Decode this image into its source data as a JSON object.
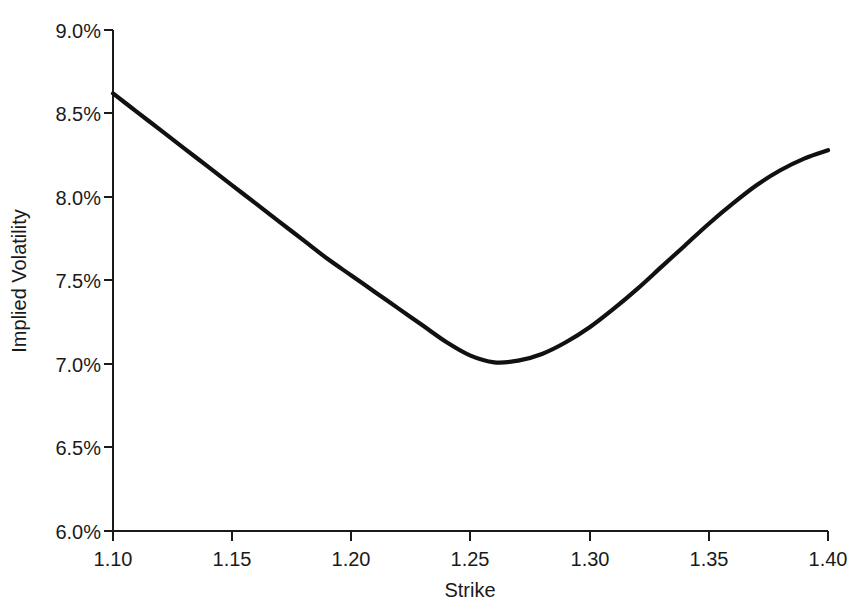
{
  "chart_data": {
    "type": "line",
    "title": "",
    "xlabel": "Strike",
    "ylabel": "Implied Volatility",
    "xlim": [
      1.1,
      1.4
    ],
    "ylim": [
      6.0,
      9.0
    ],
    "grid": false,
    "legend": null,
    "x_tick_labels": [
      "1.10",
      "1.15",
      "1.20",
      "1.25",
      "1.30",
      "1.35",
      "1.40"
    ],
    "x_ticks": [
      1.1,
      1.15,
      1.2,
      1.25,
      1.3,
      1.35,
      1.4
    ],
    "y_tick_labels": [
      "6.0%",
      "6.5%",
      "7.0%",
      "7.5%",
      "8.0%",
      "8.5%",
      "9.0%"
    ],
    "y_ticks": [
      6.0,
      6.5,
      7.0,
      7.5,
      8.0,
      8.5,
      9.0
    ],
    "y_unit": "%",
    "series": [
      {
        "name": "Implied Volatility",
        "color": "#111111",
        "line_width": 4.2,
        "x": [
          1.1,
          1.11,
          1.12,
          1.13,
          1.14,
          1.15,
          1.16,
          1.17,
          1.18,
          1.19,
          1.2,
          1.21,
          1.22,
          1.23,
          1.24,
          1.25,
          1.26,
          1.27,
          1.28,
          1.29,
          1.3,
          1.31,
          1.32,
          1.33,
          1.34,
          1.35,
          1.36,
          1.37,
          1.38,
          1.39,
          1.4
        ],
        "values": [
          8.62,
          8.51,
          8.4,
          8.29,
          8.18,
          8.07,
          7.96,
          7.85,
          7.74,
          7.63,
          7.53,
          7.43,
          7.33,
          7.23,
          7.13,
          7.05,
          7.01,
          7.02,
          7.06,
          7.13,
          7.22,
          7.33,
          7.45,
          7.58,
          7.71,
          7.84,
          7.96,
          8.07,
          8.16,
          8.23,
          8.28
        ]
      }
    ],
    "annotations": {
      "minimum_strike": 1.26,
      "minimum_value": 7.01,
      "left_endpoint_value": 8.62,
      "right_endpoint_value": 8.28
    }
  },
  "axes": {
    "x_axis_name": "strike-axis",
    "y_axis_name": "implied-volatility-axis"
  }
}
